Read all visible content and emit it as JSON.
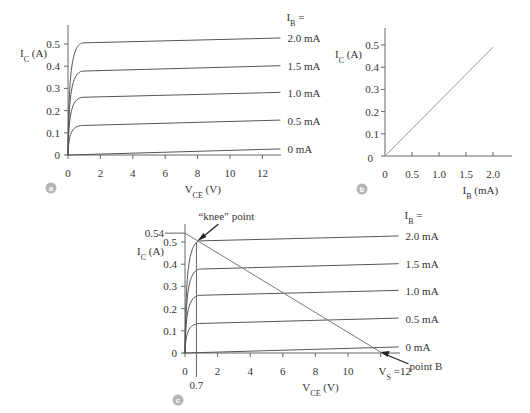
{
  "panels": {
    "a": {
      "badge": "a",
      "ylabel": "I",
      "ylabel_sub": "C",
      "ylabel_unit": " (A)",
      "xlabel": "V",
      "xlabel_sub": "CE",
      "xlabel_unit": " (V)",
      "legend_title": "I",
      "legend_title_sub": "B",
      "legend_title_suffix": " =",
      "yticks": [
        "0",
        "0.1",
        "0.2",
        "0.3",
        "0.4",
        "0.5"
      ],
      "xticks": [
        "0",
        "2",
        "4",
        "6",
        "8",
        "10",
        "12"
      ]
    },
    "b": {
      "badge": "b",
      "ylabel": "I",
      "ylabel_sub": "C",
      "ylabel_unit": " (A)",
      "xlabel": "I",
      "xlabel_sub": "B",
      "xlabel_unit": " (mA)",
      "yticks": [
        "0",
        "0.1",
        "0.2",
        "0.3",
        "0.4",
        "0.5"
      ],
      "xticks": [
        "0",
        "0.5",
        "1.0",
        "1.5",
        "2.0"
      ]
    },
    "c": {
      "badge": "c",
      "ylabel": "I",
      "ylabel_sub": "C",
      "ylabel_unit": " (A)",
      "xlabel": "V",
      "xlabel_sub": "CE",
      "xlabel_unit": " (V)",
      "legend_title": "I",
      "legend_title_sub": "B",
      "legend_title_suffix": " =",
      "yticks": [
        "0",
        "0.1",
        "0.2",
        "0.3",
        "0.4",
        "0.5"
      ],
      "y_extra_tick": "0.54",
      "xticks": [
        "0",
        "2",
        "4",
        "6",
        "8",
        "10"
      ],
      "x_extra_tick": "0.7",
      "vs_label": "V",
      "vs_sub": "S",
      "vs_suffix": " =12",
      "knee_annotation": "“knee” point",
      "pointB_annotation": "point B"
    }
  },
  "chart_data": [
    {
      "type": "line",
      "title": "(a) Transistor output characteristics",
      "xlabel": "V_CE (V)",
      "ylabel": "I_C (A)",
      "xlim": [
        0,
        12
      ],
      "ylim": [
        0,
        0.55
      ],
      "xticks": [
        0,
        2,
        4,
        6,
        8,
        10,
        12
      ],
      "yticks": [
        0,
        0.1,
        0.2,
        0.3,
        0.4,
        0.5
      ],
      "legend_title": "I_B =",
      "legend_position": "right",
      "series": [
        {
          "name": "2.0 mA",
          "x": [
            0,
            0.3,
            0.7,
            1,
            12
          ],
          "y": [
            0,
            0.45,
            0.5,
            0.505,
            0.525
          ]
        },
        {
          "name": "1.5 mA",
          "x": [
            0,
            0.3,
            0.7,
            1,
            12
          ],
          "y": [
            0,
            0.34,
            0.375,
            0.378,
            0.4
          ]
        },
        {
          "name": "1.0 mA",
          "x": [
            0,
            0.3,
            0.7,
            1,
            12
          ],
          "y": [
            0,
            0.23,
            0.258,
            0.26,
            0.28
          ]
        },
        {
          "name": "0.5 mA",
          "x": [
            0,
            0.3,
            0.7,
            1,
            12
          ],
          "y": [
            0,
            0.11,
            0.13,
            0.133,
            0.155
          ]
        },
        {
          "name": "0 mA",
          "x": [
            0,
            1,
            12
          ],
          "y": [
            0,
            0.002,
            0.025
          ]
        }
      ]
    },
    {
      "type": "line",
      "title": "(b) Current transfer characteristic",
      "xlabel": "I_B (mA)",
      "ylabel": "I_C (A)",
      "xlim": [
        0,
        2.3
      ],
      "ylim": [
        0,
        0.55
      ],
      "xticks": [
        0,
        0.5,
        1.0,
        1.5,
        2.0
      ],
      "yticks": [
        0,
        0.1,
        0.2,
        0.3,
        0.4,
        0.5
      ],
      "series": [
        {
          "name": "I_C vs I_B",
          "x": [
            0,
            2.0
          ],
          "y": [
            0,
            0.49
          ]
        }
      ]
    },
    {
      "type": "line",
      "title": "(c) Output characteristics with load line",
      "xlabel": "V_CE (V)",
      "ylabel": "I_C (A)",
      "xlim": [
        0,
        12
      ],
      "ylim": [
        0,
        0.55
      ],
      "xticks": [
        0,
        0.7,
        2,
        4,
        6,
        8,
        10,
        12
      ],
      "yticks": [
        0,
        0.1,
        0.2,
        0.3,
        0.4,
        0.5,
        0.54
      ],
      "legend_title": "I_B =",
      "legend_position": "right",
      "series": [
        {
          "name": "2.0 mA",
          "x": [
            0,
            0.3,
            0.7,
            1,
            12
          ],
          "y": [
            0,
            0.45,
            0.5,
            0.505,
            0.525
          ]
        },
        {
          "name": "1.5 mA",
          "x": [
            0,
            0.3,
            0.7,
            1,
            12
          ],
          "y": [
            0,
            0.34,
            0.375,
            0.378,
            0.4
          ]
        },
        {
          "name": "1.0 mA",
          "x": [
            0,
            0.3,
            0.7,
            1,
            12
          ],
          "y": [
            0,
            0.23,
            0.258,
            0.26,
            0.28
          ]
        },
        {
          "name": "0.5 mA",
          "x": [
            0,
            0.3,
            0.7,
            1,
            12
          ],
          "y": [
            0,
            0.11,
            0.13,
            0.133,
            0.155
          ]
        },
        {
          "name": "0 mA",
          "x": [
            0,
            1,
            12
          ],
          "y": [
            0,
            0.002,
            0.025
          ]
        },
        {
          "name": "load line",
          "x": [
            0,
            12
          ],
          "y": [
            0.54,
            0
          ]
        }
      ],
      "annotations": [
        {
          "text": "“knee” point",
          "x": 0.7,
          "y": 0.5
        },
        {
          "text": "point B",
          "x": 12,
          "y": 0
        },
        {
          "text": "V_S =12",
          "x": 12,
          "y": 0
        }
      ]
    }
  ]
}
